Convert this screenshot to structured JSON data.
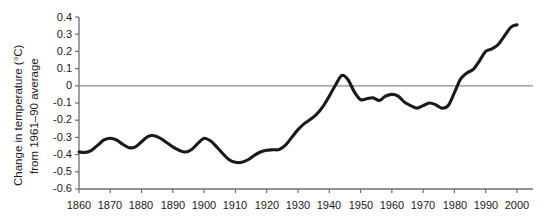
{
  "chart_data": {
    "type": "line",
    "title": "",
    "subtitle": "",
    "xlabel": "",
    "ylabel": "Change in temperature (°C) from 1961–90 average",
    "ylabel_line1": "Change in temperature (°C)",
    "ylabel_line2": "from 1961–90 average",
    "xlim": [
      1860,
      2000
    ],
    "ylim": [
      -0.6,
      0.4
    ],
    "grid": false,
    "legend": null,
    "legend_position": "none",
    "zero_reference_line": 0,
    "line_color": "#1a1a1a",
    "zero_line_color": "#8c8c8c",
    "axis_color": "#6e6e6e",
    "xticks": [
      1860,
      1870,
      1880,
      1890,
      1900,
      1910,
      1920,
      1930,
      1940,
      1950,
      1960,
      1970,
      1980,
      1990,
      2000
    ],
    "xtick_labels": [
      "1860",
      "1870",
      "1880",
      "1890",
      "1900",
      "1910",
      "1920",
      "1930",
      "1940",
      "1950",
      "1960",
      "1970",
      "1980",
      "1990",
      "2000"
    ],
    "yticks": [
      0.4,
      0.3,
      0.2,
      0.1,
      0,
      -0.1,
      -0.2,
      -0.3,
      -0.4,
      -0.5,
      -0.6
    ],
    "ytick_labels": [
      "0.4",
      "0.3",
      "0.2",
      "0.1",
      "0",
      "-0.1",
      "-0.2",
      "-0.3",
      "-0.4",
      "-0.5",
      "-0.6"
    ],
    "series": [
      {
        "name": "Global mean temperature anomaly",
        "x": [
          1860,
          1862,
          1864,
          1866,
          1868,
          1870,
          1872,
          1874,
          1876,
          1878,
          1880,
          1882,
          1884,
          1886,
          1888,
          1890,
          1892,
          1894,
          1896,
          1898,
          1900,
          1902,
          1904,
          1906,
          1908,
          1910,
          1912,
          1914,
          1916,
          1918,
          1920,
          1922,
          1924,
          1926,
          1928,
          1930,
          1932,
          1934,
          1936,
          1938,
          1940,
          1942,
          1944,
          1946,
          1948,
          1950,
          1952,
          1954,
          1956,
          1958,
          1960,
          1962,
          1964,
          1966,
          1968,
          1970,
          1972,
          1974,
          1976,
          1978,
          1980,
          1982,
          1984,
          1986,
          1988,
          1990,
          1992,
          1994,
          1996,
          1998,
          2000
        ],
        "values": [
          -0.385,
          -0.387,
          -0.375,
          -0.345,
          -0.315,
          -0.305,
          -0.315,
          -0.34,
          -0.36,
          -0.355,
          -0.325,
          -0.295,
          -0.29,
          -0.305,
          -0.33,
          -0.355,
          -0.375,
          -0.385,
          -0.37,
          -0.335,
          -0.305,
          -0.32,
          -0.355,
          -0.395,
          -0.43,
          -0.445,
          -0.445,
          -0.43,
          -0.405,
          -0.385,
          -0.375,
          -0.372,
          -0.37,
          -0.345,
          -0.3,
          -0.255,
          -0.22,
          -0.195,
          -0.165,
          -0.12,
          -0.06,
          0.005,
          0.06,
          0.035,
          -0.035,
          -0.08,
          -0.075,
          -0.07,
          -0.085,
          -0.06,
          -0.05,
          -0.06,
          -0.095,
          -0.115,
          -0.13,
          -0.115,
          -0.1,
          -0.11,
          -0.13,
          -0.115,
          -0.04,
          0.04,
          0.075,
          0.095,
          0.145,
          0.2,
          0.215,
          0.24,
          0.29,
          0.34,
          0.355
        ]
      }
    ],
    "annotations": []
  }
}
